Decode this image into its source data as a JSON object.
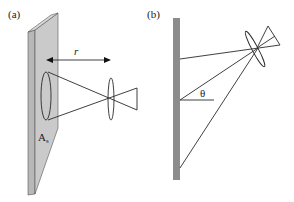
{
  "figure": {
    "panel_a": {
      "label": "(a)",
      "distance_label": "r",
      "area_label": "A",
      "area_subscript": "s"
    },
    "panel_b": {
      "label": "(b)",
      "angle_label": "θ"
    },
    "colors": {
      "slab_face": "#c8c8c8",
      "slab_side": "#b4b4b4",
      "bar": "#8c8c8c",
      "line": "#2a2a2a",
      "background": "#ffffff"
    }
  }
}
